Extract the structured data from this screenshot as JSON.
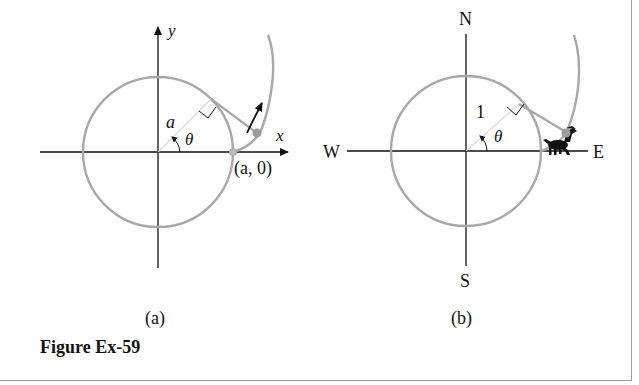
{
  "figure": {
    "caption": "Figure Ex-59",
    "panels": [
      {
        "id": "a",
        "label": "(a)",
        "axis_x_label": "x",
        "axis_y_label": "y",
        "radius_label": "a",
        "angle_label": "θ",
        "point_label": "(a, 0)"
      },
      {
        "id": "b",
        "label": "(b)",
        "north_label": "N",
        "south_label": "S",
        "west_label": "W",
        "east_label": "E",
        "radius_label": "1",
        "angle_label": "θ"
      }
    ]
  },
  "colors": {
    "axis": "#111111",
    "curve": "#a8a8a8",
    "point": "#9c9c9c",
    "border": "#9a9a9a"
  }
}
